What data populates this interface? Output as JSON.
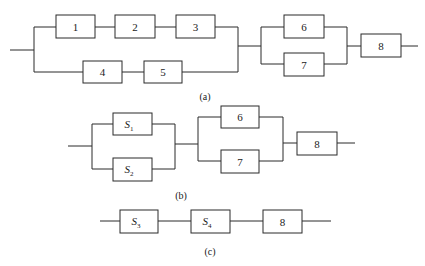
{
  "figure": {
    "type": "reliability-block-diagram",
    "panels": [
      {
        "id": "a",
        "caption": "(a)",
        "blocks": [
          {
            "label": "1"
          },
          {
            "label": "2"
          },
          {
            "label": "3"
          },
          {
            "label": "4"
          },
          {
            "label": "5"
          },
          {
            "label": "6"
          },
          {
            "label": "7"
          },
          {
            "label": "8"
          }
        ],
        "structure": "[(1-2-3) || (4-5)] -> [6 || 7] -> 8"
      },
      {
        "id": "b",
        "caption": "(b)",
        "blocks": [
          {
            "label": "S",
            "sub": "1"
          },
          {
            "label": "S",
            "sub": "2"
          },
          {
            "label": "6"
          },
          {
            "label": "7"
          },
          {
            "label": "8"
          }
        ],
        "structure": "[S1 || S2] -> [6 || 7] -> 8"
      },
      {
        "id": "c",
        "caption": "(c)",
        "blocks": [
          {
            "label": "S",
            "sub": "3"
          },
          {
            "label": "S",
            "sub": "4"
          },
          {
            "label": "8"
          }
        ],
        "structure": "S3 -> S4 -> 8"
      }
    ]
  }
}
